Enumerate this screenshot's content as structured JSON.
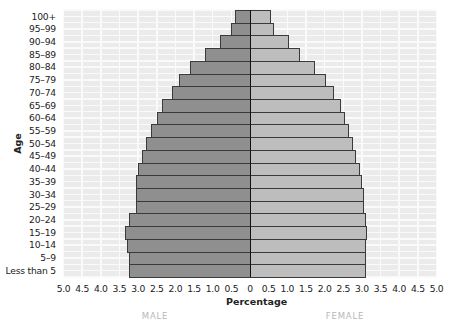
{
  "chart_data": {
    "type": "bar",
    "orientation": "horizontal",
    "subtype": "population-pyramid",
    "title": "",
    "xlabel": "Percentage",
    "ylabel": "Age",
    "categories": [
      "100+",
      "95–99",
      "90–94",
      "85–89",
      "80–84",
      "75–79",
      "70–74",
      "65–69",
      "60–64",
      "55–59",
      "50–54",
      "45–49",
      "40–44",
      "35–39",
      "30–34",
      "25–29",
      "20–24",
      "15–19",
      "10–14",
      "5–9",
      "Less than 5"
    ],
    "series": [
      {
        "name": "MALE",
        "side": "left",
        "color": "#8f8f8f",
        "values": [
          0.4,
          0.5,
          0.8,
          1.2,
          1.6,
          1.9,
          2.1,
          2.35,
          2.5,
          2.65,
          2.8,
          2.9,
          3.0,
          3.05,
          3.05,
          3.05,
          3.25,
          3.35,
          3.3,
          3.25,
          3.25
        ]
      },
      {
        "name": "FEMALE",
        "side": "right",
        "color": "#bdbdbd",
        "values": [
          0.55,
          0.65,
          1.05,
          1.35,
          1.75,
          2.05,
          2.25,
          2.45,
          2.55,
          2.65,
          2.75,
          2.85,
          2.95,
          3.0,
          3.05,
          3.05,
          3.1,
          3.15,
          3.1,
          3.1,
          3.1
        ]
      }
    ],
    "xticks_left": [
      "5.0",
      "4.5",
      "4.0",
      "3.5",
      "3.0",
      "2.5",
      "2.0",
      "1.5",
      "1.0",
      "0.5"
    ],
    "xtick_center": "0",
    "xticks_right": [
      "0.5",
      "1.0",
      "1.5",
      "2.0",
      "2.5",
      "3.0",
      "3.5",
      "4.0",
      "4.5",
      "5.0"
    ],
    "xlim": [
      -5.0,
      5.0
    ],
    "grid": true,
    "legend": {
      "position": "bottom",
      "entries": [
        "MALE",
        "FEMALE"
      ]
    }
  },
  "labels": {
    "y_axis_title": "Age",
    "x_axis_title": "Percentage",
    "male": "MALE",
    "female": "FEMALE"
  }
}
